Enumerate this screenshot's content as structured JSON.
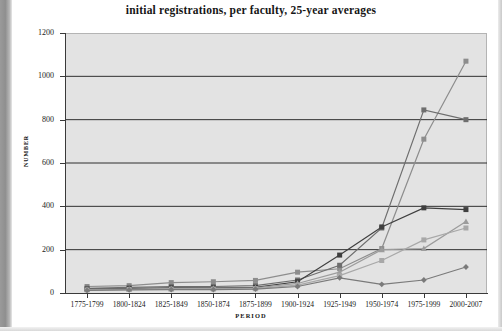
{
  "chart_data": {
    "type": "line",
    "title": "initial registrations, per faculty, 25-year averages",
    "xlabel": "PERIOD",
    "ylabel": "NUMBER",
    "categories": [
      "1775-1799",
      "1800-1824",
      "1825-1849",
      "1850-1874",
      "1875-1899",
      "1900-1924",
      "1925-1949",
      "1950-1974",
      "1975-1999",
      "2000-2007"
    ],
    "ylim": [
      0,
      1200
    ],
    "ytick_values": [
      0,
      200,
      400,
      600,
      800,
      1000,
      1200
    ],
    "ytick_labels": [
      "0",
      "200",
      "400",
      "600",
      "800",
      "1000",
      "1200"
    ],
    "grid": "horizontal",
    "legend": "none",
    "series": [
      {
        "name": "series-1",
        "color": "#8d8d8d",
        "marker": "square",
        "values": [
          30,
          34,
          48,
          52,
          58,
          96,
          112,
          205,
          710,
          1070
        ]
      },
      {
        "name": "series-2",
        "color": "#6e6e6e",
        "marker": "square",
        "values": [
          22,
          26,
          30,
          30,
          34,
          60,
          128,
          300,
          845,
          800
        ]
      },
      {
        "name": "series-3",
        "color": "#3f3f3f",
        "marker": "square",
        "values": [
          18,
          20,
          24,
          24,
          26,
          52,
          175,
          305,
          393,
          385
        ]
      },
      {
        "name": "series-4",
        "color": "#9c9c9c",
        "marker": "triangle",
        "values": [
          16,
          18,
          20,
          22,
          24,
          44,
          96,
          200,
          205,
          330
        ]
      },
      {
        "name": "series-5",
        "color": "#a8a8a8",
        "marker": "square",
        "values": [
          14,
          16,
          18,
          18,
          20,
          36,
          80,
          150,
          245,
          300
        ]
      },
      {
        "name": "series-6",
        "color": "#7a7a7a",
        "marker": "diamond",
        "values": [
          12,
          14,
          16,
          16,
          18,
          30,
          70,
          40,
          60,
          120
        ]
      }
    ]
  },
  "axis": {
    "y_ticks": [
      "1200",
      "1000",
      "800",
      "600",
      "400",
      "200",
      "0"
    ]
  }
}
